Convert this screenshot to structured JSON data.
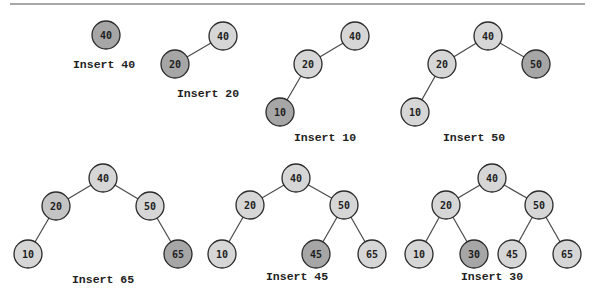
{
  "figure": {
    "colors": {
      "node_default": "#d6d6d6",
      "node_inserted": "#a6a6a6",
      "node_medium": "#c4c4c4",
      "edge": "#4a4a4a",
      "rule": "#8a8a8a"
    },
    "node_radius": 14,
    "top_rule": {
      "x1": 10,
      "y1": 4,
      "x2": 585,
      "y2": 4
    },
    "steps": [
      {
        "label": "Insert 40",
        "label_pos": [
          104,
          64
        ],
        "nodes": [
          {
            "value": "40",
            "x": 106,
            "y": 35,
            "style": "inserted"
          }
        ],
        "edges": []
      },
      {
        "label": "Insert 20",
        "label_pos": [
          208,
          93
        ],
        "nodes": [
          {
            "value": "40",
            "x": 223,
            "y": 36,
            "style": "default"
          },
          {
            "value": "20",
            "x": 175,
            "y": 64,
            "style": "inserted"
          }
        ],
        "edges": [
          [
            0,
            1
          ]
        ]
      },
      {
        "label": "Insert 10",
        "label_pos": [
          325,
          137
        ],
        "nodes": [
          {
            "value": "40",
            "x": 355,
            "y": 36,
            "style": "default"
          },
          {
            "value": "20",
            "x": 308,
            "y": 64,
            "style": "default"
          },
          {
            "value": "10",
            "x": 280,
            "y": 112,
            "style": "inserted"
          }
        ],
        "edges": [
          [
            0,
            1
          ],
          [
            1,
            2
          ]
        ]
      },
      {
        "label": "Insert 50",
        "label_pos": [
          474,
          137
        ],
        "nodes": [
          {
            "value": "40",
            "x": 488,
            "y": 36,
            "style": "default"
          },
          {
            "value": "20",
            "x": 442,
            "y": 64,
            "style": "default"
          },
          {
            "value": "50",
            "x": 536,
            "y": 64,
            "style": "inserted"
          },
          {
            "value": "10",
            "x": 415,
            "y": 112,
            "style": "default"
          }
        ],
        "edges": [
          [
            0,
            1
          ],
          [
            0,
            2
          ],
          [
            1,
            3
          ]
        ]
      },
      {
        "label": "Insert 65",
        "label_pos": [
          103,
          279
        ],
        "nodes": [
          {
            "value": "40",
            "x": 103,
            "y": 178,
            "style": "default"
          },
          {
            "value": "20",
            "x": 56,
            "y": 206,
            "style": "medium"
          },
          {
            "value": "50",
            "x": 150,
            "y": 206,
            "style": "default"
          },
          {
            "value": "10",
            "x": 28,
            "y": 254,
            "style": "default"
          },
          {
            "value": "65",
            "x": 178,
            "y": 254,
            "style": "inserted"
          }
        ],
        "edges": [
          [
            0,
            1
          ],
          [
            0,
            2
          ],
          [
            1,
            3
          ],
          [
            2,
            4
          ]
        ]
      },
      {
        "label": "Insert 45",
        "label_pos": [
          297,
          276
        ],
        "nodes": [
          {
            "value": "40",
            "x": 296,
            "y": 178,
            "style": "default"
          },
          {
            "value": "20",
            "x": 250,
            "y": 205,
            "style": "default"
          },
          {
            "value": "50",
            "x": 344,
            "y": 205,
            "style": "default"
          },
          {
            "value": "10",
            "x": 222,
            "y": 254,
            "style": "default"
          },
          {
            "value": "45",
            "x": 316,
            "y": 254,
            "style": "inserted"
          },
          {
            "value": "65",
            "x": 372,
            "y": 254,
            "style": "default"
          }
        ],
        "edges": [
          [
            0,
            1
          ],
          [
            0,
            2
          ],
          [
            1,
            3
          ],
          [
            2,
            4
          ],
          [
            2,
            5
          ]
        ]
      },
      {
        "label": "Insert 30",
        "label_pos": [
          492,
          276
        ],
        "nodes": [
          {
            "value": "40",
            "x": 492,
            "y": 178,
            "style": "default"
          },
          {
            "value": "20",
            "x": 446,
            "y": 205,
            "style": "default"
          },
          {
            "value": "50",
            "x": 539,
            "y": 205,
            "style": "default"
          },
          {
            "value": "10",
            "x": 419,
            "y": 254,
            "style": "default"
          },
          {
            "value": "30",
            "x": 474,
            "y": 254,
            "style": "inserted"
          },
          {
            "value": "45",
            "x": 512,
            "y": 254,
            "style": "default"
          },
          {
            "value": "65",
            "x": 567,
            "y": 254,
            "style": "default"
          }
        ],
        "edges": [
          [
            0,
            1
          ],
          [
            0,
            2
          ],
          [
            1,
            3
          ],
          [
            1,
            4
          ],
          [
            2,
            5
          ],
          [
            2,
            6
          ]
        ]
      }
    ]
  }
}
